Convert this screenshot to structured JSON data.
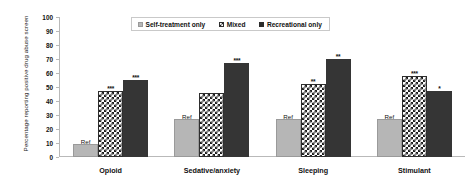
{
  "chart_data": {
    "type": "bar",
    "title": "",
    "xlabel": "",
    "ylabel": "Percentage reporting positive drug abuse screen",
    "ylim": [
      0,
      100
    ],
    "yticks": [
      0,
      10,
      20,
      30,
      40,
      50,
      60,
      70,
      80,
      90,
      100
    ],
    "grid": false,
    "legend_position": "top-center",
    "categories": [
      "Opioid",
      "Sedative/anxiety",
      "Sleeping",
      "Stimulant"
    ],
    "series": [
      {
        "name": "Self-treatment only",
        "values": [
          9,
          27,
          27,
          27
        ],
        "annotations": [
          "Ref",
          "Ref",
          "Ref",
          "Ref"
        ]
      },
      {
        "name": "Mixed",
        "values": [
          47,
          46,
          52,
          58
        ],
        "annotations": [
          "***",
          "",
          "**",
          "***"
        ]
      },
      {
        "name": "Recreational only",
        "values": [
          55,
          67,
          70,
          47
        ],
        "annotations": [
          "***",
          "***",
          "**",
          "*"
        ]
      }
    ],
    "colors": {
      "self_treatment_only": "#b6b6b6",
      "mixed": "#1c1c1c",
      "recreational_only": "#353535",
      "axis": "#b9b9b9",
      "text": "#111111",
      "background": "#ffffff"
    }
  },
  "legend": {
    "items": [
      {
        "label": "Self-treatment only",
        "swatch": "light-gray-square"
      },
      {
        "label": "Mixed",
        "swatch": "checkered-square"
      },
      {
        "label": "Recreational only",
        "swatch": "black-square"
      }
    ]
  }
}
